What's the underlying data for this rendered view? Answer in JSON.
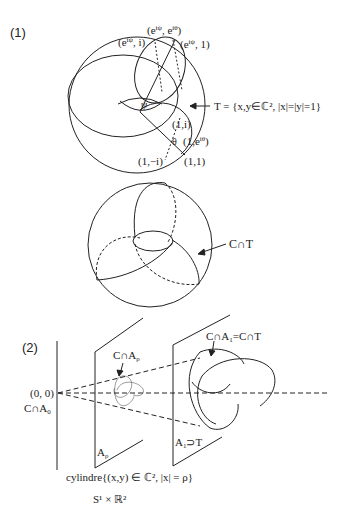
{
  "figure": {
    "part1": {
      "label": "(1)",
      "torus_points": {
        "top_center": "(e^{iψ}, e^{iθ})",
        "top_left": "(e^{iψ}, i)",
        "top_right": "(e^{iψ}, 1)",
        "one_i": "(1,i)",
        "one_eitheta": "(1,e^{iθ})",
        "one_minus_i": "(1,−i)",
        "one_one": "(1,1)",
        "psi": "ψ",
        "theta": "θ"
      },
      "torus_definition": "T = {x,y∈ℂ², |x|=|y|=1}",
      "sphere_arrow_label": "C∩T"
    },
    "part2": {
      "label": "(2)",
      "origin": "(0, 0)",
      "c_cap_a0": "C∩A₀",
      "c_cap_arho": "C∩A_ρ",
      "c_cap_a1": "C∩A₁=C∩T",
      "a_rho": "A_ρ",
      "a1_supset_t": "A₁⊃T",
      "cylinder_caption": "cylindre{(x,y) ∈ ℂ², |x| = ρ}",
      "product_caption": "S¹ × ℝ²"
    }
  }
}
